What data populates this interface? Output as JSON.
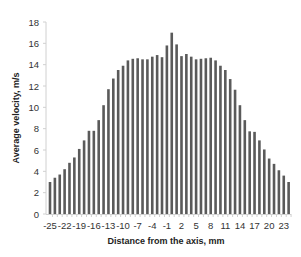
{
  "chart_data": {
    "type": "bar",
    "title": "",
    "xlabel": "Distance from the axis, mm",
    "ylabel": "Average velocity, m/s",
    "ylim": [
      0,
      18
    ],
    "yticks": [
      0,
      2,
      4,
      6,
      8,
      10,
      12,
      14,
      16,
      18
    ],
    "xtick_labels": [
      "-25",
      "-22",
      "-19",
      "-16",
      "-13",
      "-10",
      "-7",
      "-4",
      "-1",
      "2",
      "5",
      "8",
      "11",
      "14",
      "17",
      "20",
      "23"
    ],
    "grid": false,
    "legend": null,
    "bar_color": "#5a5a5a",
    "categories": [
      -25,
      -24,
      -23,
      -22,
      -21,
      -20,
      -19,
      -18,
      -17,
      -16,
      -15,
      -14,
      -13,
      -12,
      -11,
      -10,
      -9,
      -8,
      -7,
      -6,
      -5,
      -4,
      -3,
      -2,
      -1,
      0,
      1,
      2,
      3,
      4,
      5,
      6,
      7,
      8,
      9,
      10,
      11,
      12,
      13,
      14,
      15,
      16,
      17,
      18,
      19,
      20,
      21,
      22,
      23,
      24
    ],
    "values": [
      3.0,
      3.4,
      3.7,
      4.2,
      4.8,
      5.3,
      6.1,
      6.9,
      7.8,
      7.8,
      8.8,
      10.2,
      11.7,
      12.7,
      13.5,
      13.9,
      14.4,
      14.55,
      14.6,
      14.5,
      14.5,
      14.75,
      14.9,
      14.7,
      15.8,
      17.0,
      15.9,
      14.8,
      15.0,
      14.75,
      14.5,
      14.55,
      14.6,
      14.65,
      14.4,
      13.9,
      13.5,
      12.65,
      11.65,
      10.2,
      8.8,
      7.75,
      7.7,
      6.9,
      6.05,
      5.2,
      4.7,
      4.1,
      3.6,
      3.0
    ]
  }
}
